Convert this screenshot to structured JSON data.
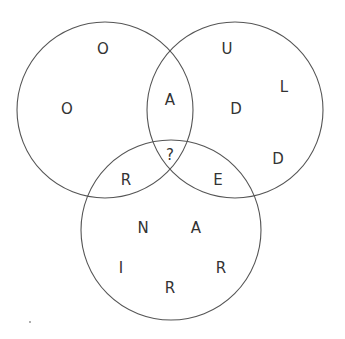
{
  "diagram": {
    "type": "venn",
    "stroke_color": "#555555",
    "text_color": "#333333",
    "circles": [
      {
        "id": "top-left",
        "cx": 105,
        "cy": 110,
        "r": 88
      },
      {
        "id": "top-right",
        "cx": 235,
        "cy": 110,
        "r": 88
      },
      {
        "id": "bottom",
        "cx": 171,
        "cy": 230,
        "r": 90
      }
    ],
    "letters": [
      {
        "region": "top-left-only",
        "char": "O",
        "x": 103,
        "y": 49
      },
      {
        "region": "top-left-only",
        "char": "O",
        "x": 67,
        "y": 109
      },
      {
        "region": "top-left+top-right",
        "char": "A",
        "x": 170,
        "y": 100
      },
      {
        "region": "top-left+bottom",
        "char": "R",
        "x": 126,
        "y": 180
      },
      {
        "region": "center",
        "char": "?",
        "x": 170,
        "y": 155
      },
      {
        "region": "top-right-only",
        "char": "U",
        "x": 227,
        "y": 49
      },
      {
        "region": "top-right-only",
        "char": "L",
        "x": 284,
        "y": 87
      },
      {
        "region": "top-right-only",
        "char": "D",
        "x": 236,
        "y": 109
      },
      {
        "region": "top-right-only",
        "char": "D",
        "x": 278,
        "y": 159
      },
      {
        "region": "top-right+bottom",
        "char": "E",
        "x": 218,
        "y": 180
      },
      {
        "region": "bottom-only",
        "char": "N",
        "x": 143,
        "y": 228
      },
      {
        "region": "bottom-only",
        "char": "A",
        "x": 196,
        "y": 228
      },
      {
        "region": "bottom-only",
        "char": "I",
        "x": 121,
        "y": 268
      },
      {
        "region": "bottom-only",
        "char": "R",
        "x": 221,
        "y": 268
      },
      {
        "region": "bottom-only",
        "char": "R",
        "x": 170,
        "y": 288
      }
    ]
  }
}
